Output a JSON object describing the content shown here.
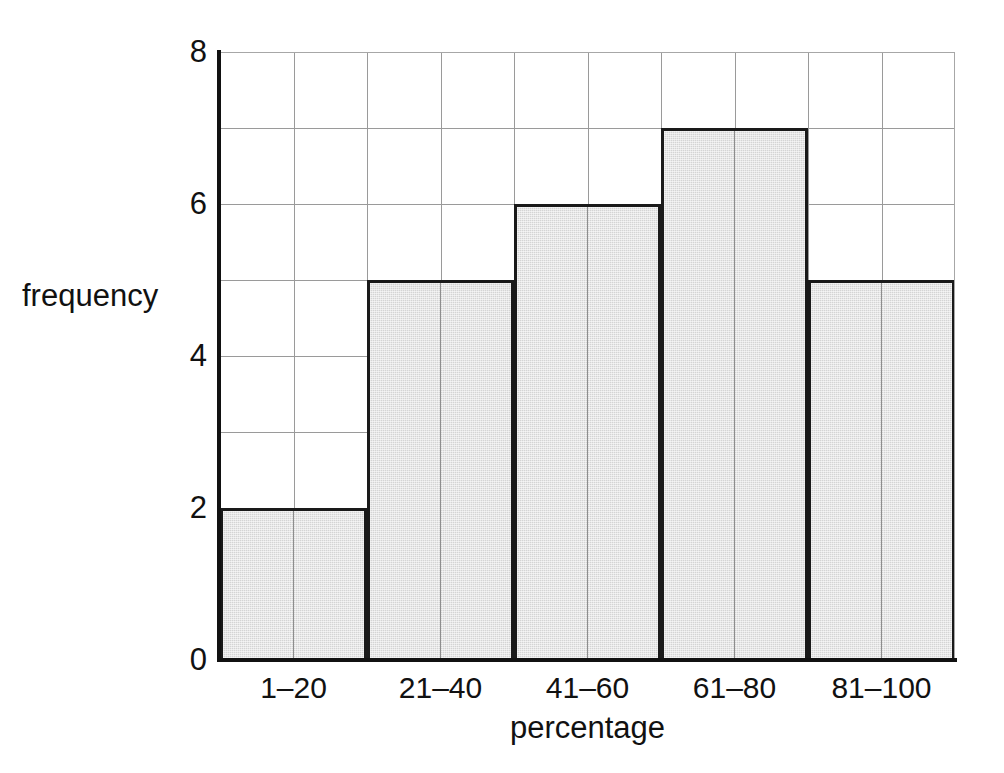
{
  "chart_data": {
    "type": "bar",
    "title": "",
    "subtitle": "",
    "xlabel": "percentage",
    "ylabel": "frequency",
    "categories": [
      "1–20",
      "21–40",
      "41–60",
      "61–80",
      "81–100"
    ],
    "values": [
      2,
      5,
      6,
      7,
      5
    ],
    "series": [
      {
        "name": "frequency",
        "values": [
          2,
          5,
          6,
          7,
          5
        ]
      }
    ],
    "ylim": [
      0,
      8
    ],
    "y_ticks": [
      0,
      2,
      4,
      6,
      8
    ],
    "y_tick_labels": [
      "0",
      "2",
      "4",
      "6",
      "8"
    ],
    "y_gridlines": [
      1,
      2,
      3,
      4,
      5,
      6,
      7
    ],
    "y_major_step": 2,
    "y_minor_step": 1,
    "x_minor_divisions_per_bar": 2,
    "grid": true,
    "legend": false,
    "legend_position": "none",
    "annotations": [],
    "bar_gap": 0,
    "colors": {
      "bar_fill": "#d4d4d4",
      "bar_edge": "#1a1a1a",
      "gridline": "#9a9a9a",
      "axis": "#111111",
      "background": "#ffffff",
      "text": "#111111",
      "frame": "#a7a7a7"
    }
  }
}
